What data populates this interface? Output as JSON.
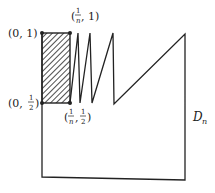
{
  "diagram": {
    "region_label": {
      "main": "D",
      "sub": "n"
    },
    "points": [
      {
        "id": "p01",
        "label": "(0, 1)"
      },
      {
        "id": "p0half",
        "label_prefix": "(0,",
        "frac_num": "1",
        "frac_den": "2",
        "label_suffix": ")"
      },
      {
        "id": "pn1",
        "frac_num": "1",
        "frac_den": "n",
        "label_suffix": ", 1)"
      },
      {
        "id": "pnhalf",
        "frac1_num": "1",
        "frac1_den": "n",
        "frac2_num": "1",
        "frac2_den": "2"
      }
    ],
    "colors": {
      "stroke": "#222222",
      "background": "#ffffff"
    }
  }
}
